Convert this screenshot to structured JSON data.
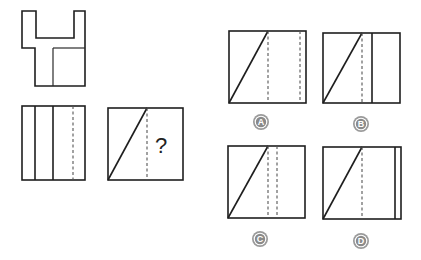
{
  "puzzle": {
    "type": "three-view projection",
    "top_view": {
      "label": "top-view"
    },
    "front_view": {
      "label": "front-view"
    },
    "side_view": {
      "label": "side-view",
      "question_mark": "?"
    },
    "options": [
      {
        "letter": "A",
        "inner_lines": [
          "dashed",
          "dashed"
        ]
      },
      {
        "letter": "B",
        "inner_lines": [
          "dashed",
          "solid"
        ]
      },
      {
        "letter": "C",
        "inner_lines": [
          "dashed",
          "dashed"
        ]
      },
      {
        "letter": "D",
        "inner_lines": [
          "dashed",
          "solid-near-edge"
        ]
      }
    ]
  },
  "colors": {
    "line": "#1e1e1e",
    "dashed": "#555555",
    "badge_fill": "#8a8a8a",
    "badge_ring": "#9a9a9a"
  }
}
